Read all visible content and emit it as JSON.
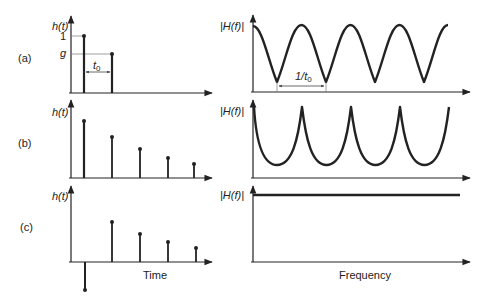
{
  "panels": [
    {
      "id": "a",
      "label": "(a)",
      "time_ylabel": "h(t)",
      "freq_ylabel": "|H(f)|",
      "tick_one": "1",
      "tick_g": "g",
      "time_interval_label": "t",
      "time_interval_sub": "0",
      "freq_interval_label": "1/t",
      "freq_interval_sub": "0"
    },
    {
      "id": "b",
      "label": "(b)",
      "time_ylabel": "h(t)",
      "freq_ylabel": "|H(f)|"
    },
    {
      "id": "c",
      "label": "(c)",
      "time_ylabel": "h(t)",
      "freq_ylabel": "|H(f)|"
    }
  ],
  "xlabels": {
    "time": "Time",
    "frequency": "Frequency"
  },
  "colors": {
    "ink": "#222222",
    "guide": "#666666"
  }
}
